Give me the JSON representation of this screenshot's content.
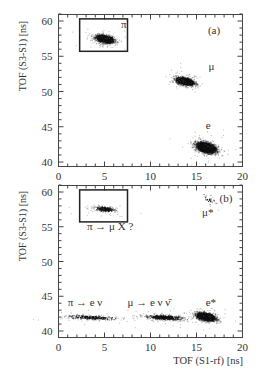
{
  "figure": {
    "panels": [
      {
        "id": "a",
        "panel_label": "(a)",
        "ylabel": "TOF (S3-S1) [ns]",
        "xlabel": "",
        "yticks": [
          "40",
          "45",
          "50",
          "55",
          "60"
        ],
        "xticks": [
          "0",
          "5",
          "10",
          "15",
          "20"
        ],
        "annotations": [
          {
            "text": "π",
            "x": 6.8,
            "y": 59.0
          },
          {
            "text": "μ",
            "x": 16.3,
            "y": 53.0
          },
          {
            "text": "e",
            "x": 16.0,
            "y": 44.7
          }
        ]
      },
      {
        "id": "b",
        "panel_label": "(b)",
        "ylabel": "TOF (S3-S1) [ns]",
        "xlabel": "TOF (S1-rf) [ns]",
        "yticks": [
          "40",
          "45",
          "50",
          "55",
          "60"
        ],
        "xticks": [
          "0",
          "5",
          "10",
          "15",
          "20"
        ],
        "annotations": [
          {
            "text": "π → μ X ?",
            "x": 3.1,
            "y": 54.6
          },
          {
            "text": "μ*",
            "x": 15.6,
            "y": 56.5
          },
          {
            "text": "π → e ν",
            "x": 1.0,
            "y": 43.6
          },
          {
            "text": "μ → e ν ν̄",
            "x": 7.5,
            "y": 43.6
          },
          {
            "text": "e*",
            "x": 16.0,
            "y": 43.6
          }
        ]
      }
    ]
  },
  "chart_data": [
    {
      "type": "scatter",
      "title": "(a)",
      "xlabel": "TOF (S1-rf) [ns]",
      "ylabel": "TOF (S3-S1) [ns]",
      "xlim": [
        0,
        20
      ],
      "ylim": [
        39.5,
        61
      ],
      "grid": false,
      "legend": null,
      "clusters": [
        {
          "name": "π",
          "center_x": 5.0,
          "center_y": 57.5,
          "spread_x": 0.9,
          "spread_y": 0.6,
          "density": "high"
        },
        {
          "name": "μ",
          "center_x": 13.7,
          "center_y": 51.5,
          "spread_x": 0.9,
          "spread_y": 0.6,
          "density": "high"
        },
        {
          "name": "e",
          "center_x": 16.0,
          "center_y": 42.1,
          "spread_x": 1.0,
          "spread_y": 0.8,
          "density": "very high"
        }
      ],
      "selection_box": {
        "x": [
          2.3,
          7.5
        ],
        "y": [
          55.7,
          60.3
        ]
      }
    },
    {
      "type": "scatter",
      "title": "(b)",
      "xlabel": "TOF (S1-rf) [ns]",
      "ylabel": "TOF (S3-S1) [ns]",
      "xlim": [
        0,
        20
      ],
      "ylim": [
        39.5,
        61
      ],
      "grid": false,
      "legend": null,
      "clusters": [
        {
          "name": "π → μ X ?",
          "center_x": 5.0,
          "center_y": 57.6,
          "spread_x": 1.1,
          "spread_y": 0.4,
          "density": "low"
        },
        {
          "name": "μ*",
          "center_x": 16.3,
          "center_y": 59.0,
          "spread_x": 0.6,
          "spread_y": 1.0,
          "density": "very low"
        },
        {
          "name": "π → e ν",
          "center_x": 3.5,
          "center_y": 42.0,
          "spread_x": 2.5,
          "spread_y": 0.4,
          "density": "low"
        },
        {
          "name": "μ → e ν ν̄",
          "center_x": 11.5,
          "center_y": 42.0,
          "spread_x": 2.0,
          "spread_y": 0.4,
          "density": "medium"
        },
        {
          "name": "e*",
          "center_x": 16.0,
          "center_y": 42.1,
          "spread_x": 0.9,
          "spread_y": 0.6,
          "density": "very high"
        }
      ],
      "selection_box": {
        "x": [
          2.3,
          7.5
        ],
        "y": [
          55.7,
          60.3
        ]
      }
    }
  ]
}
